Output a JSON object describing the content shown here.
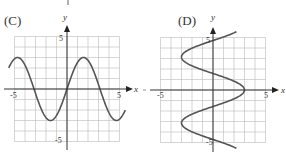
{
  "chart_data": [
    {
      "type": "line",
      "panel_label": "(C)",
      "title": "",
      "xlabel": "x",
      "ylabel": "y",
      "xlim": [
        -5,
        5
      ],
      "ylim": [
        -5,
        5
      ],
      "grid": true,
      "x_tick_labels": [
        "-5",
        "5"
      ],
      "y_tick_labels": [
        "5",
        "-5"
      ],
      "equation": "y = 3 sin x",
      "series": [
        {
          "name": "curve",
          "x": [
            -5.5,
            -4.712,
            -3.1416,
            -1.5708,
            0,
            1.5708,
            3.1416,
            4.712,
            5.5
          ],
          "y": [
            2.12,
            3,
            0,
            -3,
            0,
            3,
            0,
            -3,
            -2.12
          ]
        }
      ]
    },
    {
      "type": "line",
      "panel_label": "(D)",
      "title": "",
      "xlabel": "x",
      "ylabel": "y",
      "xlim": [
        -5,
        5
      ],
      "ylim": [
        -5,
        5
      ],
      "grid": true,
      "x_tick_labels": [
        "-5",
        "5"
      ],
      "y_tick_labels": [
        "5",
        "-5"
      ],
      "equation": "x = 3 cos y",
      "series": [
        {
          "name": "curve",
          "x": [
            2.13,
            -3,
            0,
            3,
            0,
            -3,
            2.13
          ],
          "y": [
            5.5,
            3.1416,
            1.5708,
            0,
            -1.5708,
            -3.1416,
            -5.5
          ]
        }
      ]
    }
  ],
  "panels": {
    "c": {
      "label": "(C)",
      "x_axis": "x",
      "y_axis": "y",
      "x_min": "-5",
      "x_max": "5",
      "y_max": "5",
      "y_min": "-5"
    },
    "d": {
      "label": "(D)",
      "x_axis": "x",
      "y_axis": "y",
      "x_min": "-5",
      "x_max": "5",
      "y_max": "5",
      "y_min": "-5"
    }
  }
}
